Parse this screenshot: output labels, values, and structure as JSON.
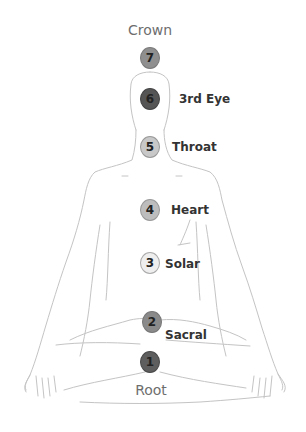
{
  "diagram": {
    "top_label": "Crown",
    "bottom_label": "Root",
    "chakras": [
      {
        "number": "7",
        "name": "",
        "x": 150,
        "y": 58,
        "color": "#8f8f8f",
        "border": "#7a7a7a"
      },
      {
        "number": "6",
        "name": "3rd Eye",
        "x": 150,
        "y": 99,
        "color": "#555555",
        "border": "#444444"
      },
      {
        "number": "5",
        "name": "Throat",
        "x": 150,
        "y": 147,
        "color": "#c8c8c8",
        "border": "#999999"
      },
      {
        "number": "4",
        "name": "Heart",
        "x": 150,
        "y": 210,
        "color": "#bdbdbd",
        "border": "#999999"
      },
      {
        "number": "3",
        "name": "Solar",
        "x": 150,
        "y": 263,
        "color": "#eeeeee",
        "border": "#aaaaaa"
      },
      {
        "number": "2",
        "name": "Sacral",
        "x": 152,
        "y": 322,
        "color": "#8a8a8a",
        "border": "#777777"
      },
      {
        "number": "1",
        "name": "",
        "x": 150,
        "y": 362,
        "color": "#5e5e5e",
        "border": "#4a4a4a"
      }
    ]
  }
}
